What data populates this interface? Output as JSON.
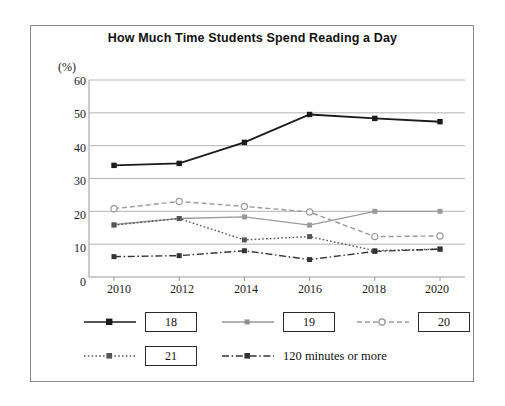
{
  "chart_data": {
    "type": "line",
    "title": "How Much Time Students Spend Reading a Day",
    "unit_label": "(%)",
    "xlabel": "",
    "ylabel": "",
    "ylim": [
      0,
      60
    ],
    "ytick_step": 10,
    "yticks": [
      "0",
      "10",
      "20",
      "30",
      "40",
      "50",
      "60"
    ],
    "categories": [
      "2010",
      "2012",
      "2014",
      "2016",
      "2018",
      "2020"
    ],
    "grid": "horizontal",
    "legend_position": "below",
    "series": [
      {
        "name": "18",
        "boxed_label": true,
        "color": "#1a1a1a",
        "style": "solid",
        "marker": "square-filled",
        "values": [
          34.0,
          34.6,
          41.0,
          49.5,
          48.3,
          47.3
        ]
      },
      {
        "name": "19",
        "boxed_label": true,
        "color": "#9a9a9a",
        "style": "solid",
        "marker": "square-filled",
        "values": [
          16.0,
          17.8,
          18.3,
          15.8,
          20.0,
          20.0
        ]
      },
      {
        "name": "20",
        "boxed_label": true,
        "color": "#9a9a9a",
        "style": "dashed",
        "marker": "circle-open",
        "values": [
          20.8,
          23.0,
          21.5,
          19.8,
          12.3,
          12.5
        ]
      },
      {
        "name": "21",
        "boxed_label": true,
        "color": "#555555",
        "style": "dotted",
        "marker": "square-filled",
        "values": [
          15.8,
          17.8,
          11.3,
          12.3,
          8.0,
          8.5
        ]
      },
      {
        "name": "120 minutes or more",
        "boxed_label": false,
        "color": "#333333",
        "style": "dashdot",
        "marker": "square-filled",
        "values": [
          6.2,
          6.5,
          8.0,
          5.3,
          7.8,
          8.5
        ]
      }
    ]
  },
  "legend": {
    "rows": [
      [
        "18",
        "19",
        "20"
      ],
      [
        "21",
        "120 minutes or more"
      ]
    ]
  }
}
